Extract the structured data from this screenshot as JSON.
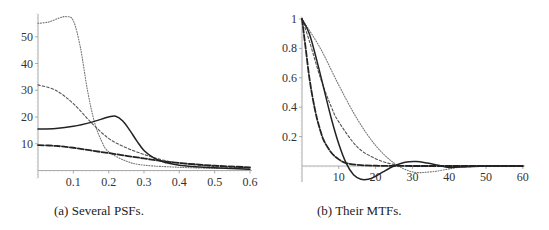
{
  "chart_data": [
    {
      "type": "line",
      "title": "",
      "caption": "(a) Several PSFs.",
      "xlabel": "",
      "ylabel": "",
      "xlim": [
        0,
        0.6
      ],
      "ylim": [
        0,
        58
      ],
      "xticks": [
        0.1,
        0.2,
        0.3,
        0.4,
        0.5,
        0.6
      ],
      "xtick_labels": [
        "0.1",
        "0.2",
        "0.3",
        "0.4",
        "0.5",
        "0.6"
      ],
      "yticks": [
        10,
        20,
        30,
        40,
        50
      ],
      "ytick_labels": [
        "10",
        "20",
        "30",
        "40",
        "50"
      ],
      "grid": false,
      "legend": null,
      "series": [
        {
          "name": "PSF dotted (sparse)",
          "style": "dotted",
          "x": [
            0,
            0.03,
            0.06,
            0.08,
            0.1,
            0.12,
            0.14,
            0.16,
            0.18,
            0.2,
            0.25,
            0.3,
            0.4,
            0.5,
            0.6
          ],
          "y": [
            55,
            55.5,
            57,
            57.5,
            56,
            46,
            30,
            18,
            11,
            7,
            3.5,
            2,
            1.2,
            0.8,
            0.6
          ]
        },
        {
          "name": "PSF short-dashed",
          "style": "short-dash",
          "x": [
            0,
            0.05,
            0.1,
            0.15,
            0.2,
            0.25,
            0.3,
            0.35,
            0.4,
            0.5,
            0.6
          ],
          "y": [
            32,
            30,
            25,
            18,
            12,
            8.5,
            6,
            4,
            2.8,
            1.5,
            1
          ]
        },
        {
          "name": "PSF solid",
          "style": "solid",
          "x": [
            0,
            0.05,
            0.1,
            0.15,
            0.2,
            0.22,
            0.24,
            0.26,
            0.28,
            0.3,
            0.33,
            0.36,
            0.4,
            0.5,
            0.6
          ],
          "y": [
            15.5,
            15.7,
            16.5,
            18,
            20,
            20.3,
            18.5,
            15,
            11,
            7.5,
            4.5,
            3,
            2,
            1,
            0.5
          ]
        },
        {
          "name": "PSF long-dashed",
          "style": "long-dash",
          "x": [
            0,
            0.05,
            0.1,
            0.15,
            0.2,
            0.25,
            0.3,
            0.35,
            0.4,
            0.5,
            0.6
          ],
          "y": [
            9.5,
            9.2,
            8.5,
            7.5,
            6.5,
            5.5,
            4.5,
            3.5,
            2.8,
            1.8,
            1.2
          ]
        }
      ]
    },
    {
      "type": "line",
      "title": "",
      "caption": "(b) Their MTFs.",
      "xlabel": "",
      "ylabel": "",
      "xlim": [
        0,
        60
      ],
      "ylim": [
        -0.1,
        1
      ],
      "xticks": [
        10,
        20,
        30,
        40,
        50,
        60
      ],
      "xtick_labels": [
        "10",
        "20",
        "30",
        "40",
        "50",
        "60"
      ],
      "yticks": [
        0.2,
        0.4,
        0.6,
        0.8,
        1
      ],
      "ytick_labels": [
        "0.2",
        "0.4",
        "0.6",
        "0.8",
        "1"
      ],
      "grid": false,
      "legend": null,
      "series": [
        {
          "name": "MTF dotted (sparse)",
          "style": "dotted",
          "x": [
            0,
            5,
            10,
            15,
            20,
            25,
            30,
            35,
            40,
            45,
            50,
            60
          ],
          "y": [
            1,
            0.8,
            0.55,
            0.32,
            0.14,
            0.02,
            -0.04,
            -0.04,
            -0.02,
            0,
            0,
            0
          ]
        },
        {
          "name": "MTF short-dashed",
          "style": "short-dash",
          "x": [
            0,
            2,
            5,
            8,
            10,
            15,
            20,
            25,
            30,
            40,
            50,
            60
          ],
          "y": [
            1,
            0.85,
            0.6,
            0.4,
            0.3,
            0.13,
            0.05,
            0.01,
            0,
            0,
            0,
            0
          ]
        },
        {
          "name": "MTF solid",
          "style": "solid",
          "x": [
            0,
            2,
            4,
            6,
            8,
            10,
            12,
            14,
            16,
            18,
            20,
            22,
            25,
            28,
            31,
            34,
            37,
            40,
            45,
            50,
            60
          ],
          "y": [
            1,
            0.9,
            0.72,
            0.52,
            0.32,
            0.15,
            0.02,
            -0.06,
            -0.09,
            -0.09,
            -0.07,
            -0.04,
            0.0,
            0.025,
            0.03,
            0.02,
            0.005,
            -0.01,
            -0.005,
            0,
            0
          ]
        },
        {
          "name": "MTF long-dashed",
          "style": "long-dash",
          "x": [
            0,
            1,
            2,
            3,
            4,
            5,
            6,
            8,
            10,
            12,
            15,
            20,
            30,
            40,
            60
          ],
          "y": [
            1,
            0.8,
            0.6,
            0.45,
            0.33,
            0.24,
            0.17,
            0.09,
            0.045,
            0.02,
            0.008,
            0.002,
            0,
            0,
            0
          ]
        }
      ]
    }
  ],
  "captions": {
    "a": "(a) Several PSFs.",
    "b": "(b) Their MTFs."
  }
}
